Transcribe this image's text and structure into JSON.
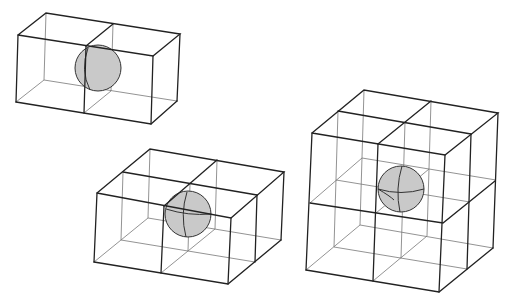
{
  "diagram": {
    "title": "",
    "colors": {
      "edge": "#222222",
      "inner_edge": "#777777",
      "sphere_fill": "#c9c9c9",
      "background": "#ffffff"
    },
    "figures": [
      {
        "id": "two-cell",
        "cells": "2x1x1",
        "sphere_position": "shared face between two cubes"
      },
      {
        "id": "four-cell",
        "cells": "2x2x1",
        "sphere_position": "shared edge of four cubes"
      },
      {
        "id": "eight-cell",
        "cells": "2x2x2",
        "sphere_position": "shared corner of eight cubes"
      }
    ]
  }
}
